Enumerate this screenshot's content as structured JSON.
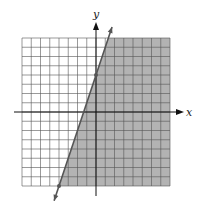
{
  "chart_data": {
    "type": "line",
    "title": "",
    "xlabel": "x",
    "ylabel": "y",
    "xlim": [
      -8,
      8
    ],
    "ylim": [
      -8,
      8
    ],
    "grid": true,
    "grid_step": 1,
    "boundary_line": {
      "equation": "y = 3x + 4",
      "slope": 3,
      "intercept": 4,
      "style": "solid"
    },
    "plotted_points": [
      {
        "x": 0,
        "y": 4
      },
      {
        "x": -4,
        "y": -8
      }
    ],
    "shaded_region": "right of line (y <= 3x + 4)",
    "colors": {
      "shade": "#b3b3b3",
      "grid": "#555555",
      "line": "#555555",
      "axis": "#111111"
    }
  },
  "labels": {
    "x_axis": "x",
    "y_axis": "y"
  }
}
